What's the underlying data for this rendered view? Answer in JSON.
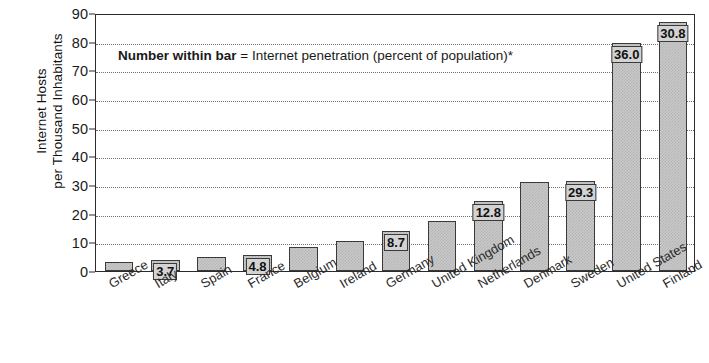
{
  "chart_data": {
    "type": "bar",
    "title": "",
    "xlabel": "",
    "ylabel_line1": "Internet Hosts",
    "ylabel_line2": "per Thousand Inhabitants",
    "ylim": [
      0,
      90
    ],
    "yticks": [
      0,
      10,
      20,
      30,
      40,
      50,
      60,
      70,
      80,
      90
    ],
    "grid": true,
    "legend": "none",
    "annotation_bold": "Number within bar",
    "annotation_rest": " = Internet penetration (percent of population)*",
    "categories": [
      "Greece",
      "Italy",
      "Spain",
      "France",
      "Belgium",
      "Ireland",
      "Germany",
      "United Kingdom",
      "Netherlands",
      "Denmark",
      "Sweden",
      "United States",
      "Finland"
    ],
    "values": [
      3.0,
      4.0,
      5.0,
      5.5,
      8.5,
      10.5,
      14.0,
      17.5,
      24.5,
      31.0,
      31.5,
      79.5,
      87.0
    ],
    "bar_labels": [
      "",
      "3.7",
      "",
      "4.8",
      "",
      "",
      "8.7",
      "",
      "12.8",
      "",
      "29.3",
      "36.0",
      "30.8"
    ],
    "series_name": "Internet hosts per thousand inhabitants"
  },
  "colors": {
    "bar_fill": "#c9c9c9",
    "bar_border": "#3a3a3a",
    "axis": "#2b2b2b",
    "grid": "#6f6f6f",
    "text": "#1a1a1a",
    "label_box": "#d3d3d3"
  }
}
